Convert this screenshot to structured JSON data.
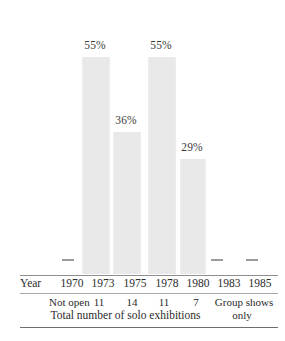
{
  "chart_data": {
    "type": "bar",
    "title": "",
    "subtitle": "",
    "xlabel": "Year",
    "ylabel": "",
    "ylim": [
      0,
      100
    ],
    "grid": false,
    "legend": "none",
    "categories": [
      "1970",
      "1973",
      "1975",
      "1978",
      "1980",
      "1983",
      "1985"
    ],
    "values": [
      null,
      55,
      36,
      55,
      29,
      null,
      null
    ],
    "data_labels": [
      "",
      "55%",
      "36%",
      "55%",
      "29%",
      "",
      ""
    ],
    "bar_color": "#e9e9e9",
    "points": [
      {
        "year": "1970",
        "percent": null,
        "label": "",
        "solo_exhibitions": "Not open",
        "marker": "dash"
      },
      {
        "year": "1973",
        "percent": 55,
        "label": "55%",
        "solo_exhibitions": "11",
        "marker": "bar"
      },
      {
        "year": "1975",
        "percent": 36,
        "label": "36%",
        "solo_exhibitions": "14",
        "marker": "bar"
      },
      {
        "year": "1978",
        "percent": 55,
        "label": "55%",
        "solo_exhibitions": "11",
        "marker": "bar"
      },
      {
        "year": "1980",
        "percent": 29,
        "label": "29%",
        "solo_exhibitions": "7",
        "marker": "bar"
      },
      {
        "year": "1983",
        "percent": null,
        "label": "",
        "solo_exhibitions": "Group shows",
        "marker": "dash"
      },
      {
        "year": "1985",
        "percent": null,
        "label": "",
        "solo_exhibitions": "only",
        "marker": "dash"
      }
    ],
    "annotations": {
      "axis_row_title": "Year",
      "counts_caption": "Total number of solo exhibitions",
      "note_not_open": "Not open",
      "note_group_shows": "Group shows",
      "note_group_shows_second_line": "only"
    }
  },
  "axis": {
    "row_title": "Year",
    "ticks": [
      "1970",
      "1973",
      "1975",
      "1978",
      "1980",
      "1983",
      "1985"
    ]
  },
  "bars": {
    "label_1973": "55%",
    "label_1975": "36%",
    "label_1978": "55%",
    "label_1980": "29%"
  },
  "counts": {
    "c1970": "Not open",
    "c1973": "11",
    "c1975": "14",
    "c1978": "11",
    "c1980": "7",
    "c1983": "Group shows",
    "c1983_line2": "only"
  },
  "caption": {
    "text": "Total number of solo exhibitions"
  },
  "colors": {
    "bar_fill": "#e9e9e9",
    "rule": "#8e8e8e",
    "text": "#2b2b2b",
    "background": "#ffffff"
  }
}
